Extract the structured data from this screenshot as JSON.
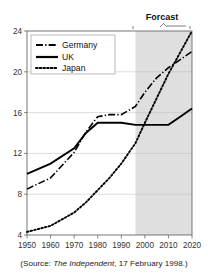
{
  "chart_data": {
    "type": "line",
    "title": "",
    "xlabel": "",
    "ylabel": "",
    "xlim": [
      1950,
      2020
    ],
    "ylim": [
      4,
      24
    ],
    "yticks": [
      4,
      8,
      12,
      16,
      20,
      24
    ],
    "xticks": [
      1950,
      1960,
      1970,
      1980,
      1990,
      2000,
      2010,
      2020
    ],
    "ytick_labels": [
      "4",
      "8",
      "12",
      "16",
      "20",
      "24"
    ],
    "xtick_labels": [
      "1950",
      "1960",
      "1970",
      "1980",
      "1990",
      "2000",
      "2010",
      "2020"
    ],
    "grid": "horizontal",
    "legend_position": "top-left",
    "x": [
      1950,
      1960,
      1970,
      1975,
      1980,
      1985,
      1990,
      1996,
      2000,
      2005,
      2010,
      2015,
      2020
    ],
    "series": [
      {
        "name": "Germany",
        "style": "dash-dot",
        "values": [
          8.5,
          9.6,
          12.1,
          14.1,
          15.6,
          15.8,
          15.8,
          16.6,
          18.0,
          19.4,
          20.4,
          21.2,
          22.0
        ]
      },
      {
        "name": "UK",
        "style": "solid",
        "values": [
          10.0,
          11.0,
          12.5,
          14.0,
          15.0,
          15.0,
          15.0,
          14.8,
          14.8,
          14.8,
          14.8,
          15.6,
          16.4
        ]
      },
      {
        "name": "Japan",
        "style": "dotted",
        "values": [
          4.3,
          4.9,
          6.2,
          7.2,
          8.4,
          9.6,
          11.0,
          13.0,
          15.0,
          17.4,
          19.8,
          21.9,
          24.0
        ]
      }
    ],
    "annotations": [
      {
        "text": "Forcast",
        "type": "region-label",
        "region_start": 1996,
        "region_end": 2020,
        "shaded": true,
        "shade_color": "#dddddd"
      }
    ],
    "caption": {
      "prefix": "(Source: ",
      "publication": "The Independent",
      "suffix": ", 17 February 1998.)"
    },
    "colors": {
      "line": "#000000",
      "grid": "#bdbdbd",
      "frame": "#555555",
      "shade": "#dddddd",
      "background": "#ffffff"
    }
  },
  "legend": {
    "items": [
      {
        "label": "Germany",
        "style": "dash-dot"
      },
      {
        "label": "UK",
        "style": "solid"
      },
      {
        "label": "Japan",
        "style": "dotted"
      }
    ]
  },
  "forecast": {
    "label": "Forcast"
  },
  "caption": {
    "prefix": "(Source: ",
    "publication": "The Independent",
    "suffix": ", 17 February 1998.)"
  },
  "yaxis": {
    "ticks": [
      "24",
      "20",
      "16",
      "12",
      "8",
      "4"
    ]
  },
  "xaxis": {
    "ticks": [
      "1950",
      "1960",
      "1970",
      "1980",
      "1990",
      "2000",
      "2010",
      "2020"
    ]
  }
}
